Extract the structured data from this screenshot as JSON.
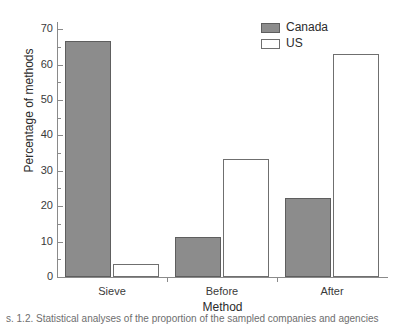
{
  "chart_data": {
    "type": "bar",
    "title": "",
    "xlabel": "Method",
    "ylabel": "Percentage of methods",
    "categories": [
      "Sieve",
      "Before",
      "After"
    ],
    "series": [
      {
        "name": "Canada",
        "color": "#8c8c8c",
        "values": [
          66.7,
          11.2,
          22.3
        ]
      },
      {
        "name": "US",
        "color": "#ffffff",
        "values": [
          3.6,
          33.4,
          63.0
        ]
      }
    ],
    "ylim": [
      0,
      72
    ],
    "ytick_labels": [
      "0",
      "10",
      "20",
      "30",
      "40",
      "50",
      "60",
      "70"
    ],
    "ytick_values": [
      0,
      10,
      20,
      30,
      40,
      50,
      60,
      70
    ],
    "yminor_tick_values": [
      5,
      15,
      25,
      35,
      45,
      55,
      65
    ],
    "grid": false,
    "legend_position": "top-right",
    "legend_entries": [
      "Canada",
      "US"
    ]
  },
  "axes": {
    "y_title": "Percentage of methods",
    "x_title": "Method"
  },
  "legend": {
    "items": [
      {
        "label": "Canada"
      },
      {
        "label": "US"
      }
    ]
  },
  "caption": {
    "fragment": "s. 1.2. Statistical analyses of the proportion of the sampled companies and agencies"
  }
}
